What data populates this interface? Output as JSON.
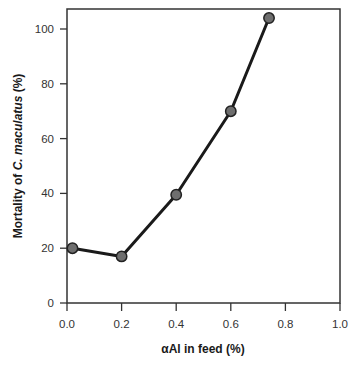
{
  "chart_data": {
    "type": "line",
    "title": "",
    "xlabel": "αAl in feed (%)",
    "ylabel_parts": {
      "prefix": "Mortality of ",
      "italic": "C. maculatus",
      "suffix": " (%)"
    },
    "ylabel": "Mortality of C. maculatus (%)",
    "xlim": [
      0.0,
      1.0
    ],
    "ylim": [
      0,
      107
    ],
    "x_ticks": [
      "0.0",
      "0.2",
      "0.4",
      "0.6",
      "0.8",
      "1.0"
    ],
    "y_ticks": [
      "0",
      "20",
      "40",
      "60",
      "80",
      "100"
    ],
    "grid": false,
    "legend": null,
    "series": [
      {
        "name": "Mortality",
        "x": [
          0.02,
          0.2,
          0.4,
          0.6,
          0.74
        ],
        "y": [
          20,
          17,
          39.5,
          70,
          104
        ],
        "line_color": "#1a1a1a",
        "marker_color": "#6e6e6e"
      }
    ]
  },
  "colors": {
    "axis": "#333333",
    "line": "#1a1a1a",
    "marker_fill": "#6e6e6e",
    "marker_stroke": "#222222"
  }
}
